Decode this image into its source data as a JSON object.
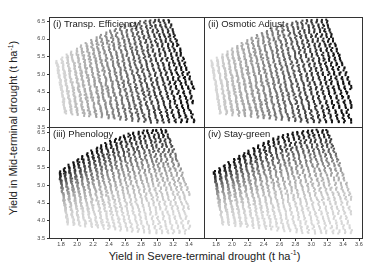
{
  "chart_data": {
    "type": "scatter",
    "layout": "2x2 panels, shared axes",
    "xlabel": "Yield in Severe-terminal drought (t ha-1)",
    "ylabel": "Yield in Mid-terminal drought (t ha-1)",
    "xlabel_main": "Yield in Severe-terminal drought (t ha",
    "ylabel_main": "Yield in Mid-terminal drought (t ha",
    "unit_sup": "-1",
    "unit_close": ")",
    "xlim": [
      1.65,
      3.62
    ],
    "ylim": [
      3.5,
      6.62
    ],
    "yticks": [
      "3.5",
      "4.0",
      "4.5",
      "5.0",
      "5.5",
      "6.0",
      "6.5"
    ],
    "xticks_left": [
      "1.8",
      "2.0",
      "2.2",
      "2.4",
      "2.6",
      "2.8",
      "3.0",
      "3.2",
      "3.4"
    ],
    "xticks_right": [
      "1.8",
      "2.0",
      "2.2",
      "2.4",
      "2.6",
      "2.8",
      "3.0",
      "3.2",
      "3.4",
      "3.6"
    ],
    "grid": false,
    "legend": "none; point shade (light grey to black) encodes trait level",
    "panels": [
      {
        "id": "i",
        "title": "(i) Transp. Efficiency",
        "shade_direction": "increases with x (light at low x, dark at high x)",
        "x_range": [
          1.75,
          3.45
        ],
        "y_range": [
          3.7,
          6.55
        ],
        "shading": "x"
      },
      {
        "id": "ii",
        "title": "(ii) Osmotic Adjust",
        "shade_direction": "increases with x (light at low x, dark at high x)",
        "x_range": [
          1.75,
          3.5
        ],
        "y_range": [
          3.7,
          6.5
        ],
        "shading": "x"
      },
      {
        "id": "iii",
        "title": "(iii) Phenology",
        "shade_direction": "increases with y (dark at high y, light at low y)",
        "x_range": [
          1.78,
          3.4
        ],
        "y_range": [
          3.7,
          6.55
        ],
        "shading": "y"
      },
      {
        "id": "iv",
        "title": "(iv) Stay-green",
        "shade_direction": "increases with y/edge (dark at upper envelope, light interior/low)",
        "x_range": [
          1.78,
          3.5
        ],
        "y_range": [
          3.7,
          6.55
        ],
        "shading": "y"
      }
    ]
  }
}
